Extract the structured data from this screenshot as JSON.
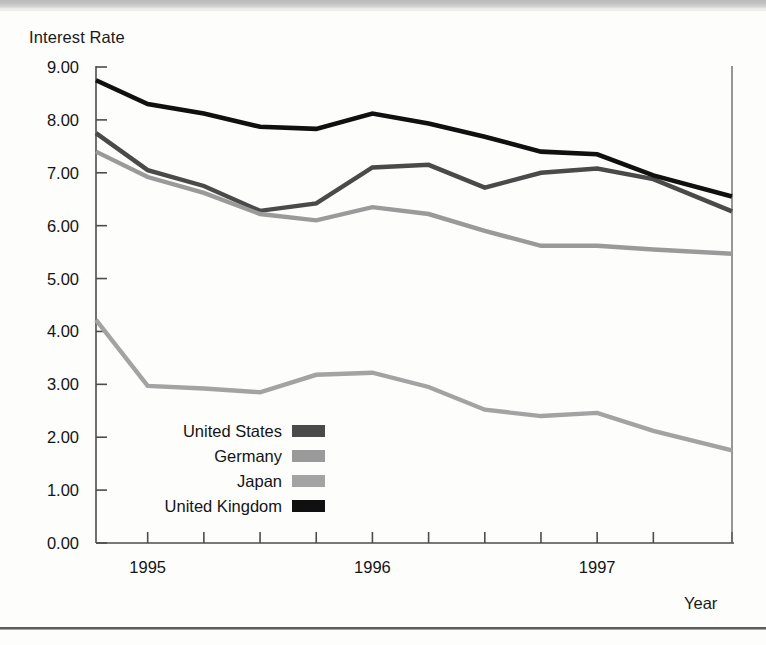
{
  "chart_data": {
    "type": "line",
    "title": "",
    "ylabel": "Interest Rate",
    "xlabel": "Year",
    "ylim": [
      0,
      9
    ],
    "ytick_labels": [
      "0.00",
      "1.00",
      "2.00",
      "3.00",
      "4.00",
      "5.00",
      "6.00",
      "7.00",
      "8.00",
      "9.00"
    ],
    "ytick_values": [
      0,
      1,
      2,
      3,
      4,
      5,
      6,
      7,
      8,
      9
    ],
    "xtick_labels": [
      "1995",
      "1996",
      "1997"
    ],
    "xtick_label_positions": [
      1995.0,
      1996.0,
      1997.0
    ],
    "xlim": [
      1994.77,
      1997.6
    ],
    "x": [
      1994.77,
      1995.0,
      1995.25,
      1995.5,
      1995.75,
      1996.0,
      1996.25,
      1996.5,
      1996.75,
      1997.0,
      1997.25,
      1997.6
    ],
    "grid": false,
    "legend_position": "inside-lower-left",
    "series": [
      {
        "name": "United States",
        "color": "#4a4a4a",
        "values": [
          7.75,
          7.05,
          6.75,
          6.28,
          6.42,
          7.1,
          7.15,
          6.72,
          7.0,
          7.08,
          6.88,
          6.27
        ]
      },
      {
        "name": "Germany",
        "color": "#9a9a9a",
        "values": [
          7.4,
          6.92,
          6.62,
          6.22,
          6.1,
          6.35,
          6.22,
          5.9,
          5.62,
          5.62,
          5.55,
          5.47
        ]
      },
      {
        "name": "Japan",
        "color": "#a3a3a3",
        "values": [
          4.22,
          2.97,
          2.92,
          2.85,
          3.18,
          3.22,
          2.95,
          2.52,
          2.4,
          2.46,
          2.12,
          1.75
        ]
      },
      {
        "name": "United Kingdom",
        "color": "#101010",
        "values": [
          8.75,
          8.3,
          8.12,
          7.87,
          7.83,
          8.12,
          7.93,
          7.68,
          7.4,
          7.35,
          6.95,
          6.55
        ]
      }
    ]
  },
  "axis": {
    "y_title": "Interest Rate",
    "x_title": "Year"
  },
  "legend": {
    "items": [
      {
        "label": "United States",
        "swatch_color": "#4a4a4a"
      },
      {
        "label": "Germany",
        "swatch_color": "#9a9a9a"
      },
      {
        "label": "Japan",
        "swatch_color": "#a3a3a3"
      },
      {
        "label": "United Kingdom",
        "swatch_color": "#101010"
      }
    ]
  }
}
